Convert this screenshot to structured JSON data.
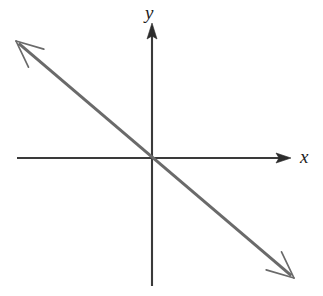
{
  "figure": {
    "kind": "cartesian-coordinate-plane",
    "width": 323,
    "height": 296,
    "background_color": "#ffffff",
    "axis_color": "#3a3a3a",
    "line_color": "#6a6a6a",
    "label_color": "#1c1c1c",
    "axis_label_x": "x",
    "axis_label_y": "y",
    "origin": {
      "x": 152,
      "y": 158
    }
  },
  "axes": {
    "x_axis": {
      "name": "x-axis",
      "from": {
        "x": 17,
        "y": 158
      },
      "to": {
        "x": 291,
        "y": 158
      },
      "stroke_width": 2,
      "arrowhead": "solid-triangle",
      "arrow_end": "right"
    },
    "y_axis": {
      "name": "y-axis",
      "from": {
        "x": 152,
        "y": 286
      },
      "to": {
        "x": 152,
        "y": 23
      },
      "stroke_width": 2,
      "arrowhead": "solid-triangle",
      "arrow_end": "top"
    }
  },
  "chart_data": {
    "type": "line",
    "title": "",
    "subtitle": "",
    "xlabel": "x",
    "ylabel": "y",
    "grid": false,
    "legend": "none",
    "annotations": [],
    "axis_style": {
      "x_axis_arrow": "right",
      "y_axis_arrow": "up",
      "origin_marked": false,
      "tick_labels": [],
      "ticks": false
    },
    "series": [
      {
        "name": "line",
        "description": "Straight line with negative slope passing through the origin, arrowheads at both ends",
        "slope": -0.85,
        "intercept": 0,
        "passes_through_origin": true,
        "quadrants": [
          "II",
          "IV"
        ],
        "endpoints_px": [
          {
            "x": 16,
            "y": 41
          },
          {
            "x": 294,
            "y": 278
          }
        ],
        "points": [
          {
            "x": -1.6,
            "y": 1.37
          },
          {
            "x": 0,
            "y": 0
          },
          {
            "x": 1.64,
            "y": -1.39
          }
        ],
        "stroke_width": 3,
        "color": "#6a6a6a",
        "arrowheads": "both-ends-open-barb"
      }
    ],
    "xlim": [
      -1.6,
      1.64
    ],
    "ylim": [
      -1.39,
      1.37
    ]
  }
}
